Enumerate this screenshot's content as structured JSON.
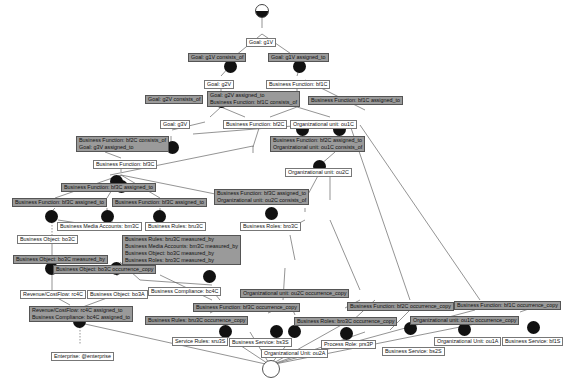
{
  "diagram": {
    "objects": [
      {
        "id": "g1V",
        "label": "Goal: g1V"
      },
      {
        "id": "g2V",
        "label": "Goal: g2V"
      },
      {
        "id": "g3V",
        "label": "Goal: g3V"
      },
      {
        "id": "bf1C",
        "label": "Business Function: bf1C"
      },
      {
        "id": "bf2C",
        "label": "Business Function: bf2C"
      },
      {
        "id": "bf3C",
        "label": "Business Function: bf3C"
      },
      {
        "id": "ou1C",
        "label": "Organizational unit: ou1C"
      },
      {
        "id": "ou2C",
        "label": "Organizational unit: ou2C"
      },
      {
        "id": "bru3C",
        "label": "Business Rules: bru3C"
      },
      {
        "id": "bro3C",
        "label": "Business Roles: bro3C"
      },
      {
        "id": "bm3C",
        "label": "Business Media Accounts: bm3C"
      },
      {
        "id": "bo3C",
        "label": "Business Object: bo3C"
      },
      {
        "id": "rc4C",
        "label": "Revenue/CostFlow: rc4C"
      },
      {
        "id": "bo3A",
        "label": "Business Object: bo3A"
      },
      {
        "id": "bc4C",
        "label": "Business Compliance: bc4C"
      },
      {
        "id": "enterprise",
        "label": "Enterprise: @enterprise"
      },
      {
        "id": "sru3S",
        "label": "Service Rules: sru3S"
      },
      {
        "id": "bs3S",
        "label": "Business Service: bs3S"
      },
      {
        "id": "ou2A",
        "label": "Organizational Unit: ou2A"
      },
      {
        "id": "prs3P",
        "label": "Process Role: prs3P"
      },
      {
        "id": "bs2S",
        "label": "Business Service: bs2S"
      },
      {
        "id": "ou1A",
        "label": "Organizational Unit: ou1A"
      },
      {
        "id": "bs1S",
        "label": "Business Service: bf1S"
      }
    ],
    "relations": [
      {
        "id": "r1",
        "lines": [
          "Goal: g1V consists_of"
        ]
      },
      {
        "id": "r2",
        "lines": [
          "Goal: g1V assigned_to"
        ]
      },
      {
        "id": "r3",
        "lines": [
          "Goal: g2V consists_of"
        ]
      },
      {
        "id": "r4",
        "lines": [
          "Goal: g2V assigned_to",
          "Business Function: bf1C consists_of"
        ]
      },
      {
        "id": "r5",
        "lines": [
          "Business Function: bf1C assigned_to"
        ]
      },
      {
        "id": "r6",
        "lines": [
          "Business Function: bf2C consists_of",
          "Goal: g3V assigned_to"
        ]
      },
      {
        "id": "r7",
        "lines": [
          "Business Function: bf2C assigned_to",
          "Organizational unit: ou1C consists_of"
        ]
      },
      {
        "id": "r8",
        "lines": [
          "Business Function: bf3C assigned_to"
        ]
      },
      {
        "id": "r9",
        "lines": [
          "Business Function: bf3C assigned_to"
        ]
      },
      {
        "id": "r10",
        "lines": [
          "Business Function: bf3C assigned_to"
        ]
      },
      {
        "id": "r11",
        "lines": [
          "Business Function: bf3C assigned_to",
          "Organizational unit: ou2C consists_of"
        ]
      },
      {
        "id": "r12",
        "lines": [
          "Business Rules: bru3C measured_by",
          "Business Media Accounts: bm3C measured_by",
          "Business Object: bo3C measured_by",
          "Business Roles: bro3C measured_by"
        ]
      },
      {
        "id": "r13",
        "lines": [
          "Business Object: bo3C measured_by"
        ]
      },
      {
        "id": "r14",
        "lines": [
          "Business Object: bo3C occurrence_copy"
        ]
      },
      {
        "id": "r15",
        "lines": [
          "Revenue/CostFlow: rc4C assigned_to",
          "Business Compliance: bc4C assigned_to"
        ]
      },
      {
        "id": "r16",
        "lines": [
          "Organizational unit: ou2C occurrence_copy"
        ]
      },
      {
        "id": "r17",
        "lines": [
          "Business Function: bf3C occurrence_copy"
        ]
      },
      {
        "id": "r18",
        "lines": [
          "Business Rules: bru3C occurrence_copy"
        ]
      },
      {
        "id": "r19",
        "lines": [
          "Business Roles: bro3C occurrence_copy"
        ]
      },
      {
        "id": "r20",
        "lines": [
          "Business Function: bf2C occurrence_copy"
        ]
      },
      {
        "id": "r21",
        "lines": [
          "Organizational unit: ou1C occurrence_copy"
        ]
      },
      {
        "id": "r22",
        "lines": [
          "Business Function: bf1C occurrence_copy"
        ]
      }
    ],
    "colors": {
      "object_fill": "#ffffff",
      "relation_fill": "#9a9a9a",
      "node": "#111111",
      "edge": "#666666"
    }
  }
}
